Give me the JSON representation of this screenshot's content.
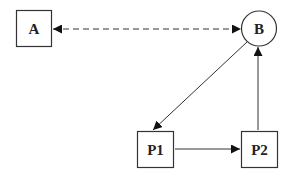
{
  "diagram": {
    "nodes": [
      {
        "id": "A",
        "label": "A",
        "shape": "square"
      },
      {
        "id": "B",
        "label": "B",
        "shape": "circle"
      },
      {
        "id": "P1",
        "label": "P1",
        "shape": "square"
      },
      {
        "id": "P2",
        "label": "P2",
        "shape": "square"
      }
    ],
    "edges": [
      {
        "from": "A",
        "to": "B",
        "style": "dashed",
        "direction": "bidirectional"
      },
      {
        "from": "B",
        "to": "P1",
        "style": "solid",
        "direction": "forward"
      },
      {
        "from": "P1",
        "to": "P2",
        "style": "solid",
        "direction": "forward"
      },
      {
        "from": "P2",
        "to": "B",
        "style": "solid",
        "direction": "forward"
      }
    ],
    "colors": {
      "stroke": "#333333",
      "dashed": "#777777",
      "arrowhead": "#111111"
    }
  }
}
